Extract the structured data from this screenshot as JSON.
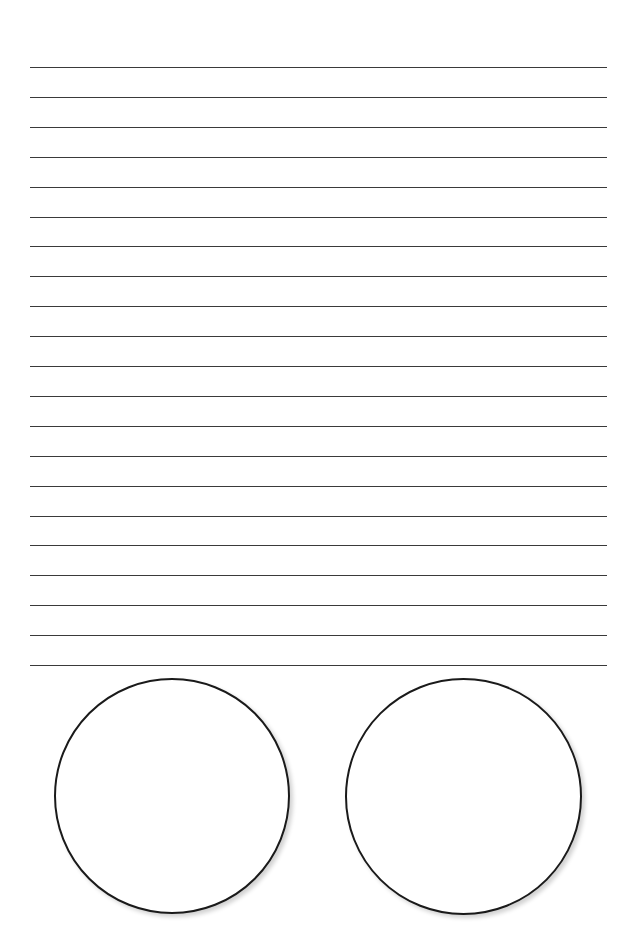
{
  "page": {
    "type": "lined-worksheet",
    "background": "#ffffff",
    "line_color": "#3a3a3a",
    "lines": {
      "count": 21,
      "first_y": 67,
      "spacing": 29.9,
      "x_start": 30,
      "x_end": 607
    },
    "circles": [
      {
        "name": "left-circle",
        "cx": 172,
        "cy": 796,
        "diameter": 236
      },
      {
        "name": "right-circle",
        "cx": 463,
        "cy": 796,
        "diameter": 237
      }
    ]
  }
}
